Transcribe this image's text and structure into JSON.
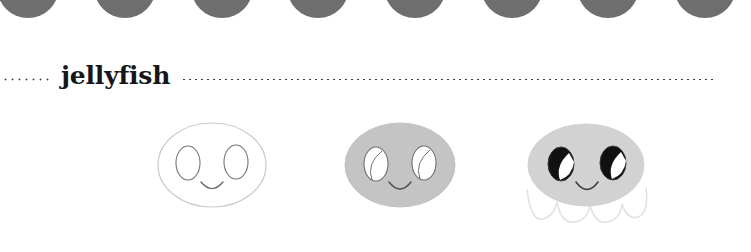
{
  "page": {
    "title": "jellyfish",
    "background_color": "#ffffff"
  },
  "decor": {
    "scallop_label": "scalloped-circle-band",
    "circle_color": "#6e6e6e",
    "circle_count": 8,
    "circle_positions_x": [
      28,
      125,
      222,
      318,
      415,
      512,
      608,
      705
    ]
  },
  "heading": {
    "label": "jellyfish",
    "text_color": "#17171a",
    "rule_color": "#3a3a3a",
    "rule_left_name": "dotted-rule-left",
    "rule_right_name": "dotted-rule-right"
  },
  "tutorial": {
    "subject": "jellyfish",
    "step_count": 3,
    "steps": [
      {
        "index": "1",
        "name": "step-outline",
        "description": "outline of head with eyes and smile",
        "body_fill": "none",
        "body_stroke": "#c9c9cf",
        "eye_fill": "none",
        "eye_stroke": "#6f6f76",
        "mouth_stroke": "#5d5d64",
        "has_tentacles": false
      },
      {
        "index": "2",
        "name": "step-shaded-body",
        "description": "head filled gray with highlighted eyes and smile",
        "body_fill": "#c4c4c4",
        "body_stroke": "#c4c4c4",
        "eye_fill": "#ffffff",
        "eye_stroke": "#6f6f76",
        "mouth_stroke": "#4e4e55",
        "has_tentacles": false
      },
      {
        "index": "3",
        "name": "step-finished",
        "description": "finished jellyfish with black eyes, smile and wavy tentacles",
        "body_fill": "#d2d2d2",
        "body_stroke": "#d2d2d2",
        "eye_fill": "#111114",
        "eye_stroke": "#3a3a3f",
        "eye_highlight_fill": "#ffffff",
        "mouth_stroke": "#3a3a3f",
        "has_tentacles": true,
        "tentacle_stroke": "#e2e2e2"
      }
    ]
  }
}
